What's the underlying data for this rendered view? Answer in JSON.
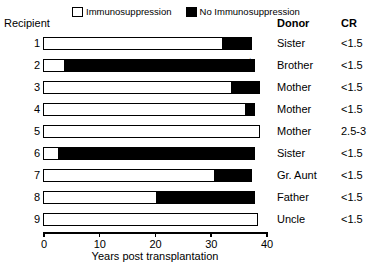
{
  "legend": {
    "items": [
      {
        "label": "Immunosuppression",
        "swatch": "white"
      },
      {
        "label": "No Immunosuppression",
        "swatch": "black"
      }
    ]
  },
  "headers": {
    "recipient": "Recipient",
    "donor": "Donor",
    "cr": "CR"
  },
  "axis": {
    "title": "Years post transplantation",
    "ticks": [
      "0",
      "10",
      "20",
      "30",
      "40"
    ]
  },
  "marker": {
    "star": "✶"
  },
  "chart_data": {
    "type": "bar",
    "orientation": "horizontal",
    "stacked": true,
    "title": "",
    "xlabel": "Years post transplantation",
    "ylabel": "Recipient",
    "xlim": [
      0,
      40
    ],
    "xticks": [
      0,
      10,
      20,
      30,
      40
    ],
    "grid": false,
    "legend_position": "top",
    "categories": [
      "1",
      "2",
      "3",
      "4",
      "5",
      "6",
      "7",
      "8",
      "9"
    ],
    "series": [
      {
        "name": "Immunosuppression",
        "color": "#ffffff",
        "values": [
          32.0,
          3.5,
          33.5,
          36.0,
          39.0,
          2.5,
          30.5,
          20.0,
          38.5
        ]
      },
      {
        "name": "No Immunosuppression",
        "color": "#000000",
        "values": [
          5.5,
          34.5,
          5.5,
          2.0,
          0.0,
          35.5,
          7.0,
          18.0,
          0.0
        ]
      }
    ],
    "rows": [
      {
        "recipient": "1",
        "immunosuppression": 32.0,
        "no_immunosuppression": 5.5,
        "total": 37.5,
        "donor": "Sister",
        "cr": "<1.5",
        "star": false
      },
      {
        "recipient": "2",
        "immunosuppression": 3.5,
        "no_immunosuppression": 34.5,
        "total": 38.0,
        "donor": "Brother",
        "cr": "<1.5",
        "star": true
      },
      {
        "recipient": "3",
        "immunosuppression": 33.5,
        "no_immunosuppression": 5.5,
        "total": 39.0,
        "donor": "Mother",
        "cr": "<1.5",
        "star": false
      },
      {
        "recipient": "4",
        "immunosuppression": 36.0,
        "no_immunosuppression": 2.0,
        "total": 38.0,
        "donor": "Mother",
        "cr": "<1.5",
        "star": false
      },
      {
        "recipient": "5",
        "immunosuppression": 39.0,
        "no_immunosuppression": 0.0,
        "total": 39.0,
        "donor": "Mother",
        "cr": "2.5-3",
        "star": false
      },
      {
        "recipient": "6",
        "immunosuppression": 2.5,
        "no_immunosuppression": 35.5,
        "total": 38.0,
        "donor": "Sister",
        "cr": "<1.5",
        "star": false
      },
      {
        "recipient": "7",
        "immunosuppression": 30.5,
        "no_immunosuppression": 7.0,
        "total": 37.5,
        "donor": "Gr. Aunt",
        "cr": "<1.5",
        "star": false
      },
      {
        "recipient": "8",
        "immunosuppression": 20.0,
        "no_immunosuppression": 18.0,
        "total": 38.0,
        "donor": "Father",
        "cr": "<1.5",
        "star": false
      },
      {
        "recipient": "9",
        "immunosuppression": 38.5,
        "no_immunosuppression": 0.0,
        "total": 38.5,
        "donor": "Uncle",
        "cr": "<1.5",
        "star": false
      }
    ]
  }
}
